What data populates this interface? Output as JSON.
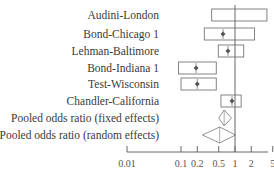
{
  "chart_data": {
    "type": "forest",
    "title": "",
    "xlabel": "",
    "ylabel": "",
    "xscale": "log",
    "xlim": [
      0.01,
      5
    ],
    "reference_line": 1,
    "xticks": [
      0.01,
      0.1,
      0.2,
      0.5,
      1,
      2,
      5
    ],
    "xtick_labels": [
      "0.01",
      "0.1",
      "0.2",
      "0.5",
      "1",
      "2",
      "5"
    ],
    "studies": [
      {
        "label": "Audini-London",
        "estimate": null,
        "ci_low": 0.37,
        "ci_high": 3.9
      },
      {
        "label": "Bond-Chicago 1",
        "estimate": 0.6,
        "ci_low": 0.27,
        "ci_high": 2.3
      },
      {
        "label": "Lehman-Baltimore",
        "estimate": 0.74,
        "ci_low": 0.49,
        "ci_high": 1.45
      },
      {
        "label": "Bond-Indiana 1",
        "estimate": 0.19,
        "ci_low": 0.09,
        "ci_high": 0.45
      },
      {
        "label": "Test-Wisconsin",
        "estimate": 0.2,
        "ci_low": 0.1,
        "ci_high": 0.45
      },
      {
        "label": "Chandler-California",
        "estimate": 0.88,
        "ci_low": 0.55,
        "ci_high": 1.3
      }
    ],
    "pooled": [
      {
        "label": "Pooled odds ratio (fixed effects)",
        "estimate": 0.63,
        "ci_low": 0.5,
        "ci_high": 0.86
      },
      {
        "label": "Pooled odds ratio (random effects)",
        "estimate": 0.52,
        "ci_low": 0.25,
        "ci_high": 1.02
      }
    ],
    "grid": false,
    "legend": null
  }
}
